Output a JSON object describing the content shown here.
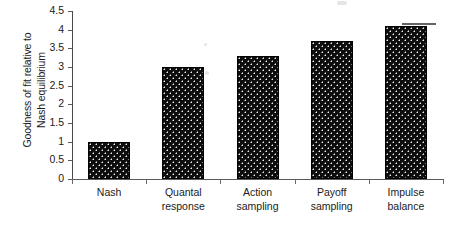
{
  "chart_data": {
    "type": "bar",
    "title": "",
    "xlabel": "",
    "ylabel": "Goodness of fit relative to Nash equilibrium",
    "ylabel_lines": [
      "Goodness of fit relative to",
      "Nash equilibrium"
    ],
    "categories": [
      "Nash",
      "Quantal response",
      "Action sampling",
      "Payoff sampling",
      "Impulse balance"
    ],
    "category_lines": [
      [
        "Nash"
      ],
      [
        "Quantal",
        "response"
      ],
      [
        "Action",
        "sampling"
      ],
      [
        "Payoff",
        "sampling"
      ],
      [
        "Impulse",
        "balance"
      ]
    ],
    "values": [
      1.0,
      3.0,
      3.3,
      3.7,
      4.1
    ],
    "ylim": [
      0,
      4.5
    ],
    "ytick_labels": [
      "0",
      "0.5",
      "1",
      "1.5",
      "2",
      "2.5",
      "3",
      "3.5",
      "4",
      "4.5"
    ],
    "ytick_values": [
      0,
      0.5,
      1,
      1.5,
      2,
      2.5,
      3,
      3.5,
      4,
      4.5
    ],
    "grid": false,
    "legend": null,
    "bar_color": "#0d0d0d",
    "bar_pattern": "white-dot-fill",
    "axis_color": "#5a5a5a",
    "background_color": "#ffffff"
  }
}
